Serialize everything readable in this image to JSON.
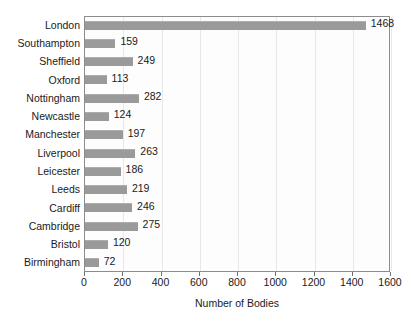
{
  "chart_data": {
    "type": "bar",
    "orientation": "horizontal",
    "title": "",
    "xlabel": "Number of Bodies",
    "ylabel": "",
    "xlim": [
      0,
      1600
    ],
    "xticks": [
      0,
      200,
      400,
      600,
      800,
      1000,
      1200,
      1400,
      1600
    ],
    "grid": true,
    "legend": false,
    "bar_color": "#9a9a9a",
    "plot_background": "#fdfdfd",
    "frame_color": "#8c8c8c",
    "gridline_color": "#e8e8ea",
    "data_labels_shown": true,
    "categories": [
      "London",
      "Southampton",
      "Sheffield",
      "Oxford",
      "Nottingham",
      "Newcastle",
      "Manchester",
      "Liverpool",
      "Leicester",
      "Leeds",
      "Cardiff",
      "Cambridge",
      "Bristol",
      "Birmingham"
    ],
    "values": [
      1468,
      159,
      249,
      113,
      282,
      124,
      197,
      263,
      186,
      219,
      246,
      275,
      120,
      72
    ],
    "value_labels": [
      "1468",
      "159",
      "249",
      "113",
      "282",
      "124",
      "197",
      "263",
      "186",
      "219",
      "246",
      "275",
      "120",
      "72"
    ],
    "xtick_labels": [
      "0",
      "200",
      "400",
      "600",
      "800",
      "1000",
      "1200",
      "1400",
      "1600"
    ]
  },
  "axis": {
    "x_title": "Number of Bodies"
  },
  "caption": ""
}
